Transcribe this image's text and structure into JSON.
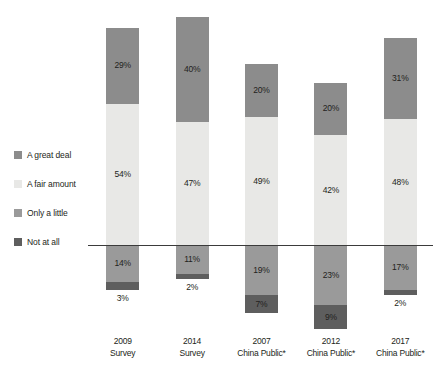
{
  "chart_data": {
    "type": "bar",
    "subtype": "diverging-stacked-bar",
    "title": "",
    "subtitle": "",
    "xlabel": "",
    "ylabel": "",
    "grid": false,
    "legend_position": "left",
    "baseline_value": 0,
    "categories": [
      "2009 Survey",
      "2014 Survey",
      "2007 China Public*",
      "2012 China Public*",
      "2017 China Public*"
    ],
    "category_lines": [
      [
        "2009",
        "Survey"
      ],
      [
        "2014",
        "Survey"
      ],
      [
        "2007",
        "China Public*"
      ],
      [
        "2012",
        "China Public*"
      ],
      [
        "2017",
        "China Public*"
      ]
    ],
    "series": [
      {
        "name": "A great deal",
        "direction": "positive",
        "color": "#8c8c8c",
        "values": [
          29,
          40,
          20,
          20,
          31
        ],
        "labels": [
          "29%",
          "40%",
          "20%",
          "20%",
          "31%"
        ]
      },
      {
        "name": "A fair amount",
        "direction": "positive",
        "color": "#e8e8e6",
        "values": [
          54,
          47,
          49,
          42,
          48
        ],
        "labels": [
          "54%",
          "47%",
          "49%",
          "42%",
          "48%"
        ]
      },
      {
        "name": "Only a little",
        "direction": "negative",
        "color": "#9a9a9a",
        "values": [
          14,
          11,
          19,
          23,
          17
        ],
        "labels": [
          "14%",
          "11%",
          "19%",
          "23%",
          "17%"
        ]
      },
      {
        "name": "Not at all",
        "direction": "negative",
        "color": "#5e5e5e",
        "values": [
          3,
          2,
          7,
          9,
          2
        ],
        "labels": [
          "3%",
          "2%",
          "7%",
          "9%",
          "2%"
        ],
        "label_placement": [
          "outside",
          "outside",
          "inside",
          "inside",
          "outside"
        ]
      }
    ]
  },
  "legend": {
    "items": [
      {
        "label": "A great deal",
        "color": "#8c8c8c"
      },
      {
        "label": "A fair amount",
        "color": "#e8e8e6"
      },
      {
        "label": "Only a little",
        "color": "#9a9a9a"
      },
      {
        "label": "Not at all",
        "color": "#5e5e5e"
      }
    ]
  },
  "axis": {
    "baseline_color": "#3b3b3b"
  }
}
